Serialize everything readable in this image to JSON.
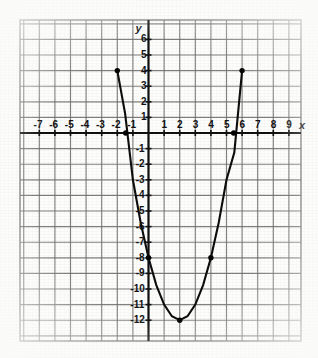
{
  "figure": {
    "kind": "coordinate-grid-graph",
    "axis_labels": {
      "x": "x",
      "y": "y"
    },
    "x_ticks": [
      "-7",
      "-6",
      "-5",
      "-4",
      "-3",
      "-2",
      "-1",
      "1",
      "2",
      "3",
      "4",
      "5",
      "6",
      "7",
      "8",
      "9"
    ],
    "y_ticks": [
      "6",
      "5",
      "4",
      "3",
      "2",
      "1",
      "-1",
      "-2",
      "-3",
      "-4",
      "-5",
      "-6",
      "-7",
      "-8",
      "-9",
      "-10",
      "-11",
      "-12"
    ],
    "colors": {
      "grid": "#6b6b6b",
      "axis": "#111111",
      "curve": "#0d0d0d",
      "point": "#000000",
      "paper": "#fdfdfc"
    }
  },
  "chart_data": {
    "type": "line",
    "title": "",
    "subtitle": "",
    "xlabel": "x",
    "ylabel": "y",
    "xlim": [
      -8,
      10
    ],
    "ylim": [
      -13,
      7
    ],
    "grid": true,
    "legend": "none",
    "equation": "y = x^2 - 4x - 8",
    "series": [
      {
        "name": "parabola",
        "x": [
          -2,
          -1.5,
          -1,
          -0.5,
          0,
          0.5,
          1,
          1.5,
          2,
          2.5,
          3,
          3.5,
          4,
          4.5,
          5,
          5.5,
          6
        ],
        "values": [
          4,
          1.25,
          -3,
          -5.75,
          -8,
          -9.75,
          -11,
          -11.75,
          -12,
          -11.75,
          -11,
          -9.75,
          -8,
          -5.75,
          -3,
          -1.25,
          4
        ]
      }
    ],
    "marked_points": [
      {
        "label": "(-2, 4)",
        "x": -2,
        "y": 4
      },
      {
        "label": "(-1.46, 0)",
        "x": -1.46,
        "y": 0
      },
      {
        "label": "(0, -8)",
        "x": 0,
        "y": -8
      },
      {
        "label": "(2, -12)",
        "x": 2,
        "y": -12
      },
      {
        "label": "(4, -8)",
        "x": 4,
        "y": -8
      },
      {
        "label": "(5.46, 0)",
        "x": 5.46,
        "y": 0
      },
      {
        "label": "(6, 4)",
        "x": 6,
        "y": 4
      }
    ],
    "x_tick_values": [
      -7,
      -6,
      -5,
      -4,
      -3,
      -2,
      -1,
      1,
      2,
      3,
      4,
      5,
      6,
      7,
      8,
      9
    ],
    "y_tick_values": [
      6,
      5,
      4,
      3,
      2,
      1,
      -1,
      -2,
      -3,
      -4,
      -5,
      -6,
      -7,
      -8,
      -9,
      -10,
      -11,
      -12
    ],
    "x_tick_labels": [
      "-7",
      "-6",
      "-5",
      "-4",
      "-3",
      "-2",
      "-1",
      "1",
      "2",
      "3",
      "4",
      "5",
      "6",
      "7",
      "8",
      "9"
    ],
    "y_tick_labels": [
      "6",
      "5",
      "4",
      "3",
      "2",
      "1",
      "-1",
      "-2",
      "-3",
      "-4",
      "-5",
      "-6",
      "-7",
      "-8",
      "-9",
      "-10",
      "-11",
      "-12"
    ]
  }
}
